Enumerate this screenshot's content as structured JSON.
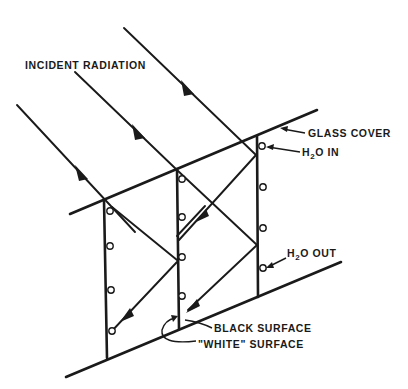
{
  "diagram": {
    "type": "solar collector cross-section with reflecting plates",
    "labels": {
      "incident_radiation": "INCIDENT RADIATION",
      "glass_cover": "GLASS COVER",
      "h2o_in_prefix": "H",
      "h2o_in_sub": "2",
      "h2o_in_suffix": "O IN",
      "h2o_out_prefix": "H",
      "h2o_out_sub": "2",
      "h2o_out_suffix": "O OUT",
      "black_surface": "BLACK SURFACE",
      "white_surface": "\"WHITE\" SURFACE"
    },
    "colors": {
      "ink": "#1a1a1a",
      "background": "#ffffff"
    },
    "components": [
      "glass-cover",
      "base-plate",
      "vertical-plate-1",
      "vertical-plate-2",
      "vertical-plate-3",
      "incident-rays",
      "reflected-rays",
      "water-tubes"
    ]
  }
}
